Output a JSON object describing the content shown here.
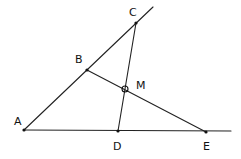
{
  "diagram": {
    "type": "geometry",
    "points": {
      "A": {
        "label": "A",
        "x": 24,
        "y": 130,
        "lx": 14,
        "ly": 125
      },
      "B": {
        "label": "B",
        "x": 87,
        "y": 70,
        "lx": 75,
        "ly": 63
      },
      "C": {
        "label": "C",
        "x": 136,
        "y": 23,
        "lx": 129,
        "ly": 16
      },
      "D": {
        "label": "D",
        "x": 118,
        "y": 131,
        "lx": 113,
        "ly": 150
      },
      "E": {
        "label": "E",
        "x": 206,
        "y": 132,
        "lx": 203,
        "ly": 150
      },
      "M": {
        "label": "M",
        "x": 125,
        "y": 89,
        "lx": 136,
        "ly": 89
      }
    },
    "segments": [
      {
        "name": "line-AC-extended",
        "from": [
          24,
          130
        ],
        "to": [
          153,
          7
        ]
      },
      {
        "name": "line-AE-extended",
        "from": [
          24,
          130
        ],
        "to": [
          231,
          131
        ]
      },
      {
        "name": "segment-CD",
        "from": [
          136,
          23
        ],
        "to": [
          118,
          131
        ]
      },
      {
        "name": "segment-BE",
        "from": [
          87,
          70
        ],
        "to": [
          206,
          132
        ]
      }
    ],
    "marked_point": "M"
  }
}
